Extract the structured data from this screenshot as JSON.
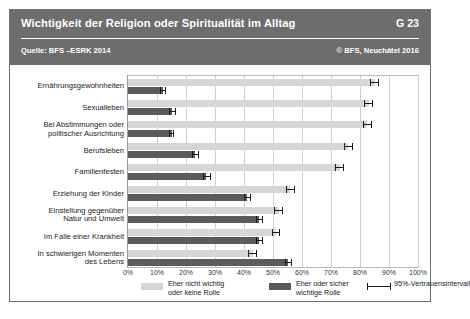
{
  "header": {
    "title": "Wichtigkeit der Religion oder Spiritualität im Alltag",
    "code": "G 23",
    "source": "Quelle: BFS –ESRK 2014",
    "copyright": "© BFS, Neuchâtel 2016",
    "bg_color": "#6d6d6d"
  },
  "legend": {
    "items": [
      {
        "label": "Eher nicht wichtig\noder keine Rolle",
        "line1": "Eher nicht wichtig",
        "line2": "oder keine Rolle",
        "color": "#d6d6d6",
        "type": "swatch"
      },
      {
        "label": "Eher oder sicher\nwichtige Rolle",
        "line1": "Eher oder sicher",
        "line2": "wichtige Rolle",
        "color": "#5b5b5b",
        "type": "swatch"
      },
      {
        "label": "95%-Vertrauensintervall",
        "line1": "95%-Vertrauensintervall",
        "line2": "",
        "color": "#1a1a1a",
        "type": "errorbar"
      }
    ]
  },
  "chart_data": {
    "type": "bar",
    "orientation": "horizontal",
    "title": "Wichtigkeit der Religion oder Spiritualität im Alltag",
    "xlabel": "",
    "ylabel": "",
    "xlim": [
      0,
      100
    ],
    "xticks": [
      0,
      10,
      20,
      30,
      40,
      50,
      60,
      70,
      80,
      90,
      100
    ],
    "xticklabels": [
      "0%",
      "10%",
      "20%",
      "30%",
      "40%",
      "50%",
      "60%",
      "70%",
      "80%",
      "90%",
      "100%"
    ],
    "grid": true,
    "legend_position": "bottom",
    "categories": [
      "Ernährungsgewohnheiten",
      "Sexualleben",
      "Bei Abstimmungen oder politischer Ausrichtung",
      "Berufsleben",
      "Familienfesten",
      "Erziehung der Kinder",
      "Einstellung gegenüber Natur und Umwelt",
      "Im Falle einer Krankheit",
      "In schwierigen Momenten des Lebens"
    ],
    "category_lines": [
      [
        "Ernährungsgewohnheiten"
      ],
      [
        "Sexualleben"
      ],
      [
        "Bei Abstimmungen oder",
        "politischer Ausrichtung"
      ],
      [
        "Berufsleben"
      ],
      [
        "Familienfesten"
      ],
      [
        "Erziehung der Kinder"
      ],
      [
        "Einstellung gegenüber",
        "Natur und Umwelt"
      ],
      [
        "Im Falle einer Krankheit"
      ],
      [
        "In schwierigen Momenten",
        "des Lebens"
      ]
    ],
    "series": [
      {
        "name": "Eher nicht wichtig oder keine Rolle",
        "color": "#d6d6d6",
        "values": [
          85,
          83,
          82.5,
          76,
          73,
          56,
          52,
          51,
          43
        ],
        "ci_low": [
          83.5,
          81.5,
          81,
          74.5,
          71.5,
          54.5,
          50.5,
          49.5,
          41.5
        ],
        "ci_high": [
          86.5,
          84.5,
          84,
          77.5,
          74.5,
          57.5,
          53.5,
          52.5,
          44.5
        ]
      },
      {
        "name": "Eher oder sicher wichtige Rolle",
        "color": "#5b5b5b",
        "values": [
          12,
          15,
          15,
          23,
          27,
          41,
          45,
          45,
          55
        ],
        "ci_low": [
          11,
          14,
          14,
          22,
          26,
          40,
          44,
          44,
          54
        ],
        "ci_high": [
          13,
          16.5,
          16,
          24.5,
          28.5,
          42.5,
          46.5,
          46.5,
          56.5
        ]
      }
    ]
  }
}
